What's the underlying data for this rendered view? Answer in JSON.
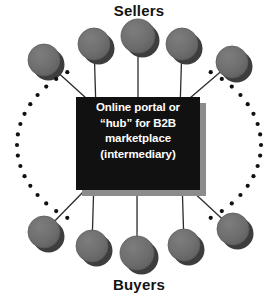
{
  "diagram": {
    "title_top": "Sellers",
    "title_bottom": "Buyers",
    "hub": {
      "lines": [
        "Online portal or",
        "“hub” for B2B",
        "marketplace",
        "(intermediary)"
      ],
      "fill_color": "#111111",
      "shadow_color": "#8c8c8c",
      "text_color": "#ffffff"
    },
    "node_colors": {
      "fill": "#6e6e6e",
      "shadow": "#3d3d3d",
      "stroke": "#5a5a5a"
    },
    "connector_color": "#2b2b2b",
    "dot_color": "#111111",
    "sellers_nodes": [
      {
        "cx": 44,
        "cy": 60,
        "r": 16
      },
      {
        "cx": 94,
        "cy": 44,
        "r": 16
      },
      {
        "cx": 138,
        "cy": 36,
        "r": 17
      },
      {
        "cx": 182,
        "cy": 44,
        "r": 16
      },
      {
        "cx": 232,
        "cy": 62,
        "r": 16
      }
    ],
    "buyers_nodes": [
      {
        "cx": 44,
        "cy": 232,
        "r": 16
      },
      {
        "cx": 92,
        "cy": 246,
        "r": 16
      },
      {
        "cx": 137,
        "cy": 253,
        "r": 17
      },
      {
        "cx": 184,
        "cy": 245,
        "r": 16
      },
      {
        "cx": 233,
        "cy": 229,
        "r": 16
      }
    ],
    "hub_box": {
      "x": 76,
      "y": 97,
      "width": 124,
      "height": 93
    },
    "left_arc_dot_count": 17,
    "right_arc_dot_count": 17
  }
}
